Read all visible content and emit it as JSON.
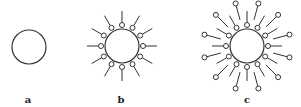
{
  "figure": {
    "stroke_color": "#333333",
    "background": "#ffffff",
    "panels": [
      {
        "id": "a",
        "label": "a",
        "label_pos": [
          28,
          95
        ],
        "center": [
          29,
          47
        ],
        "core_radius": 17,
        "inner_ring": null,
        "outer_ring": null
      },
      {
        "id": "b",
        "label": "b",
        "label_pos": [
          121,
          95
        ],
        "center": [
          122,
          46
        ],
        "core_radius": 17,
        "inner_ring": {
          "count": 12,
          "start_angle_deg": -90,
          "bead_radius": 2.5,
          "bead_distance": 21,
          "tail_end_distance": 35,
          "tail_direction": "outward"
        },
        "outer_ring": null
      },
      {
        "id": "c",
        "label": "c",
        "label_pos": [
          247,
          95
        ],
        "center": [
          247,
          46
        ],
        "core_radius": 17,
        "inner_ring": {
          "count": 12,
          "start_angle_deg": -90,
          "bead_radius": 2.5,
          "bead_distance": 21,
          "tail_end_distance": 35,
          "tail_direction": "outward"
        },
        "outer_ring": {
          "count": 12,
          "start_angle_deg": -75,
          "bead_radius": 2.5,
          "bead_distance": 44,
          "tail_end_distance": 27,
          "tail_direction": "inward"
        }
      }
    ]
  }
}
